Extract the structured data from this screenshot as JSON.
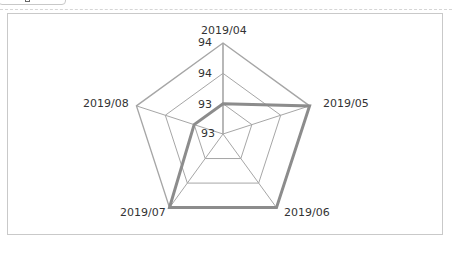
{
  "toolbar": {
    "button_label": "ng"
  },
  "chart_data": {
    "type": "radar",
    "title": "",
    "categories": [
      "2019/04",
      "2019/05",
      "2019/06",
      "2019/07",
      "2019/08"
    ],
    "series": [
      {
        "name": "Series 1",
        "values": [
          93.2,
          94.0,
          94.0,
          94.0,
          93.2
        ],
        "color": "#8c8c8c"
      }
    ],
    "radial_ticks": [
      "93",
      "93",
      "94",
      "94"
    ],
    "radial_tick_values": [
      92.8,
      93.2,
      93.6,
      94.0
    ],
    "rlim": [
      92.8,
      94.0
    ],
    "grid": true,
    "legend": "none",
    "grid_color": "#a6a6a6",
    "series_color": "#8c8c8c"
  },
  "chart": {
    "categories": [
      "2019/04",
      "2019/05",
      "2019/06",
      "2019/07",
      "2019/08"
    ],
    "ticks": [
      "93",
      "93",
      "94",
      "94"
    ]
  }
}
